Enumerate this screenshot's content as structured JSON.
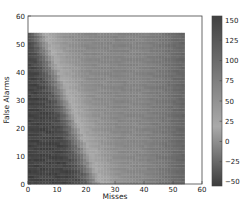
{
  "chart_data": {
    "type": "heatmap",
    "title": "",
    "xlabel": "Misses",
    "ylabel": "False Alarms",
    "xlim": [
      0,
      60
    ],
    "ylim": [
      0,
      60
    ],
    "xticks": [
      0,
      10,
      20,
      30,
      40,
      50,
      60
    ],
    "yticks": [
      0,
      10,
      20,
      30,
      40,
      50,
      60
    ],
    "data_extent": {
      "x": [
        0,
        54
      ],
      "y": [
        0,
        54
      ]
    },
    "grid": false,
    "colormap": "gray-diverging",
    "colorbar": {
      "vmin": -55,
      "vmax": 155,
      "ticks": [
        -50,
        -25,
        0,
        25,
        50,
        75,
        100,
        125,
        150
      ],
      "tick_labels": [
        "−50",
        "−25",
        "0",
        "25",
        "50",
        "75",
        "100",
        "125",
        "150"
      ]
    },
    "ridge": {
      "x_at_top": 8,
      "x_at_bottom": 27,
      "peak_value": 30
    },
    "left_value": -50,
    "mid_value": 70,
    "right_edge_value": 110
  }
}
